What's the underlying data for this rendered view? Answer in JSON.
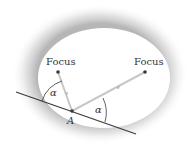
{
  "diagram": {
    "labels": {
      "focus_left": "Focus",
      "focus_right": "Focus",
      "point": "A",
      "angle_left": "α",
      "angle_right": "α"
    },
    "colors": {
      "ellipse_fill": "#ffffff",
      "shadow": "#bdbdbd",
      "tangent_line": "#3a3a3a",
      "ray": "#c8c8c8",
      "focus_point": "#3a3a3a",
      "text": "#333333"
    }
  }
}
